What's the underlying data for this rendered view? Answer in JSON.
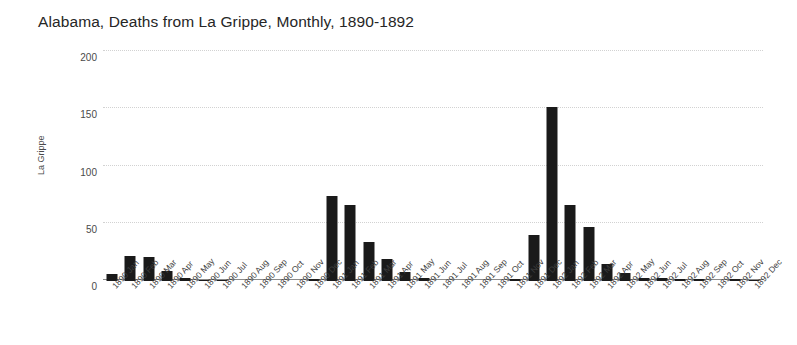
{
  "chart_data": {
    "type": "bar",
    "title": "Alabama, Deaths from La Grippe, Monthly, 1890-1892",
    "xlabel": "",
    "ylabel": "La Grippe",
    "ylim": [
      0,
      200
    ],
    "yticks": [
      0,
      50,
      100,
      150,
      200
    ],
    "grid": true,
    "legend": null,
    "bar_color": "#1a1a1a",
    "categories": [
      "1890 Jan",
      "1890 Feb",
      "1890 Mar",
      "1890 Apr",
      "1890 May",
      "1890 Jun",
      "1890 Jul",
      "1890 Aug",
      "1890 Sep",
      "1890 Oct",
      "1890 Nov",
      "1890 Dec",
      "1891 Jan",
      "1891 Feb",
      "1891 Mar",
      "1891 Apr",
      "1891 May",
      "1891 Jun",
      "1891 Jul",
      "1891 Aug",
      "1891 Sep",
      "1891 Oct",
      "1891 Nov",
      "1891 Dec",
      "1892 Jan",
      "1892 Feb",
      "1892 Mar",
      "1892 Apr",
      "1892 May",
      "1892 Jun",
      "1892 Jul",
      "1892 Aug",
      "1892 Sep",
      "1892 Oct",
      "1892 Nov",
      "1892 Dec"
    ],
    "values": [
      6,
      22,
      21,
      9,
      3,
      1,
      1,
      0,
      0,
      0,
      0,
      2,
      74,
      66,
      34,
      19,
      8,
      3,
      0,
      0,
      0,
      0,
      2,
      40,
      152,
      66,
      47,
      15,
      7,
      3,
      3,
      2,
      2,
      0,
      2,
      1
    ]
  }
}
